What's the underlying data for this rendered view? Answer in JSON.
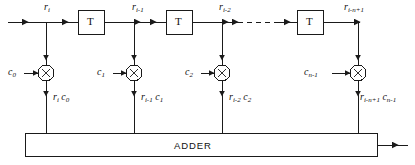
{
  "figure": {
    "type": "transversal-fir-filter-block-diagram",
    "background_color": "#ffffff",
    "line_color": "#1a1a1a",
    "signal_labels": [
      {
        "base": "r",
        "sub": "i",
        "x": 44,
        "y": 2
      },
      {
        "base": "r",
        "sub": "i-1",
        "x": 132,
        "y": 2
      },
      {
        "base": "r",
        "sub": "i-2",
        "x": 219,
        "y": 2
      },
      {
        "base": "r",
        "sub": "i-n+1",
        "x": 344,
        "y": 2
      }
    ],
    "coefficient_labels": [
      {
        "base": "c",
        "sub": "0",
        "x": 8,
        "y": 67
      },
      {
        "base": "c",
        "sub": "1",
        "x": 97,
        "y": 67
      },
      {
        "base": "c",
        "sub": "2",
        "x": 185,
        "y": 67
      },
      {
        "base": "c",
        "sub": "n-1",
        "x": 304,
        "y": 67
      }
    ],
    "product_labels": [
      {
        "terms": [
          {
            "base": "r",
            "sub": "i"
          },
          {
            "base": "c",
            "sub": "0"
          }
        ],
        "x": 53,
        "y": 92
      },
      {
        "terms": [
          {
            "base": "r",
            "sub": "i-1"
          },
          {
            "base": "c",
            "sub": "1"
          }
        ],
        "x": 141,
        "y": 92
      },
      {
        "terms": [
          {
            "base": "r",
            "sub": "i-2"
          },
          {
            "base": "c",
            "sub": "2"
          }
        ],
        "x": 229,
        "y": 92
      },
      {
        "terms": [
          {
            "base": "r",
            "sub": "i-n+1"
          },
          {
            "base": "c",
            "sub": "n-1"
          }
        ],
        "x": 360,
        "y": 92
      }
    ],
    "delay_boxes": [
      {
        "label": "T",
        "x": 78,
        "y": 10,
        "w": 26,
        "h": 24
      },
      {
        "label": "T",
        "x": 166,
        "y": 10,
        "w": 26,
        "h": 24
      },
      {
        "label": "T",
        "x": 297,
        "y": 10,
        "w": 26,
        "h": 24
      }
    ],
    "multipliers": [
      {
        "symbol": "×",
        "cx": 46,
        "cy": 73,
        "r": 8
      },
      {
        "symbol": "×",
        "cx": 134,
        "cy": 73,
        "r": 8
      },
      {
        "symbol": "×",
        "cx": 222,
        "cy": 73,
        "r": 8
      },
      {
        "symbol": "×",
        "cx": 358,
        "cy": 73,
        "r": 8
      }
    ],
    "adder": {
      "label": "ADDER",
      "x": 25,
      "y": 133,
      "w": 352,
      "h": 23,
      "label_x": 174,
      "label_y": 139
    },
    "dashed_segment": {
      "x1": 238,
      "y1": 22,
      "x2": 282,
      "y2": 22
    }
  }
}
